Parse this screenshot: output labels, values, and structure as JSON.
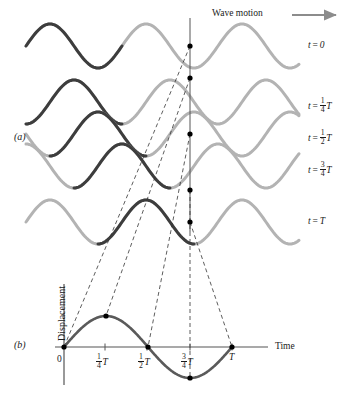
{
  "figure": {
    "wave_motion_label": "Wave motion",
    "panel_a_tag": "(a)",
    "panel_b_tag": "(b)",
    "colors": {
      "wave_dark": "#3d3d3d",
      "wave_light": "#b3b3b3",
      "axis": "#555555",
      "dashed": "#333333",
      "dot": "#000000",
      "arrow": "#8c8c8c",
      "background": "#ffffff"
    }
  },
  "panel_a": {
    "reference_line_x": 190,
    "rows": [
      {
        "time_label": "t = 0",
        "time_prefix": "t =",
        "time_value": "0",
        "fraction_num": "",
        "fraction_den": "",
        "has_T": false,
        "baseline_y": 46,
        "phase_shift_px": 0,
        "dot_y": 46,
        "dot_state": "zero-descending"
      },
      {
        "time_label": "t = 1/4 T",
        "time_prefix": "t =",
        "time_value": "",
        "fraction_num": "1",
        "fraction_den": "4",
        "has_T": true,
        "baseline_y": 102,
        "phase_shift_px": 24,
        "dot_y": 78,
        "dot_state": "crest"
      },
      {
        "time_label": "t = 1/2 T",
        "time_prefix": "t =",
        "time_value": "",
        "fraction_num": "1",
        "fraction_den": "2",
        "has_T": true,
        "baseline_y": 134,
        "phase_shift_px": 48,
        "dot_y": 134,
        "dot_state": "zero-ascending"
      },
      {
        "time_label": "t = 3/4 T",
        "time_prefix": "t =",
        "time_value": "",
        "fraction_num": "3",
        "fraction_den": "4",
        "has_T": true,
        "baseline_y": 166,
        "phase_shift_px": 72,
        "dot_y": 190,
        "dot_state": "trough"
      },
      {
        "time_label": "t = T",
        "time_prefix": "t =",
        "time_value": "T",
        "fraction_num": "",
        "fraction_den": "",
        "has_T": false,
        "baseline_y": 222,
        "phase_shift_px": 96,
        "dot_y": 222,
        "dot_state": "zero-descending"
      }
    ]
  },
  "panel_b": {
    "y_axis_title": "Displacement",
    "x_axis_title": "Time",
    "origin_label": "0",
    "ticks": [
      {
        "label": "0",
        "num": "",
        "den": "",
        "has_T": false,
        "x": 64
      },
      {
        "label": "1/4 T",
        "num": "1",
        "den": "4",
        "has_T": true,
        "x": 105
      },
      {
        "label": "1/2 T",
        "num": "1",
        "den": "2",
        "has_T": true,
        "x": 147
      },
      {
        "label": "3/4 T",
        "num": "3",
        "den": "4",
        "has_T": true,
        "x": 190
      },
      {
        "label": "T",
        "num": "",
        "den": "",
        "has_T": true,
        "x": 232
      }
    ]
  },
  "chart_data": {
    "type": "line",
    "xlabel": "Time",
    "ylabel": "Displacement",
    "xlim": [
      0,
      1
    ],
    "ylim": [
      -1,
      1
    ],
    "grid": false,
    "legend": null,
    "x_tick_labels": [
      "0",
      "1/4 T",
      "1/2 T",
      "3/4 T",
      "T"
    ],
    "x_tick_values": [
      0,
      0.25,
      0.5,
      0.75,
      1
    ],
    "series": [
      {
        "name": "Displacement y(t) = A sin(2 pi t / T)",
        "x": [
          0,
          0.25,
          0.5,
          0.75,
          1
        ],
        "values": [
          0,
          1,
          0,
          -1,
          0
        ]
      }
    ],
    "marked_points": [
      {
        "x": 0,
        "y": 0,
        "label": "t = 0",
        "source_row": 1
      },
      {
        "x": 0.25,
        "y": 1,
        "label": "t = 1/4 T",
        "source_row": 2
      },
      {
        "x": 0.5,
        "y": 0,
        "label": "t = 1/2 T",
        "source_row": 3
      },
      {
        "x": 0.75,
        "y": -1,
        "label": "t = 3/4 T",
        "source_row": 4
      },
      {
        "x": 1,
        "y": 0,
        "label": "t = T",
        "source_row": 5
      }
    ],
    "snapshots": {
      "type": "line",
      "description": "Five snapshots of a travelling sine wave, each advanced by one quarter wavelength",
      "wavelength_px": 96,
      "amplitude_px": 22,
      "series": [
        {
          "name": "t = 0",
          "phase_fraction": 0.0,
          "value_at_reference": 0
        },
        {
          "name": "t = 1/4 T",
          "phase_fraction": 0.25,
          "value_at_reference": 1
        },
        {
          "name": "t = 1/2 T",
          "phase_fraction": 0.5,
          "value_at_reference": 0
        },
        {
          "name": "t = 3/4 T",
          "phase_fraction": 0.75,
          "value_at_reference": -1
        },
        {
          "name": "t = T",
          "phase_fraction": 1.0,
          "value_at_reference": 0
        }
      ]
    }
  }
}
